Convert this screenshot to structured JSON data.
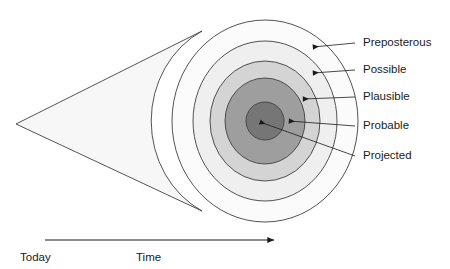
{
  "diagram": {
    "background_color": "#ffffff",
    "stroke_color": "#3f3f3f",
    "text_color": "#1a1a1a",
    "cone": {
      "apex_x": 16,
      "apex_y": 124,
      "fill": "#f7f7f7"
    },
    "center": {
      "x": 265,
      "y": 121
    },
    "zones": [
      {
        "key": "preposterous",
        "label": "Preposterous",
        "fill": "#fbfbfb",
        "rx": 93,
        "ry": 101,
        "label_x": 363,
        "label_y": 43,
        "arrow_tip_x": 313,
        "arrow_tip_y": 47,
        "leader_x": 355,
        "leader_y": 43
      },
      {
        "key": "possible",
        "label": "Possible",
        "fill": "#efefef",
        "rx": 72,
        "ry": 80,
        "label_x": 363,
        "label_y": 70,
        "arrow_tip_x": 313,
        "arrow_tip_y": 73,
        "leader_x": 355,
        "leader_y": 70
      },
      {
        "key": "plausible",
        "label": "Plausible",
        "fill": "#d4d4d4",
        "rx": 55,
        "ry": 60,
        "label_x": 363,
        "label_y": 97,
        "arrow_tip_x": 303,
        "arrow_tip_y": 99,
        "leader_x": 355,
        "leader_y": 97
      },
      {
        "key": "probable",
        "label": "Probable",
        "fill": "#9e9e9e",
        "rx": 40,
        "ry": 43,
        "label_x": 363,
        "label_y": 126,
        "arrow_tip_x": 289,
        "arrow_tip_y": 121,
        "leader_x": 355,
        "leader_y": 126
      },
      {
        "key": "projected",
        "label": "Projected",
        "fill": "#767676",
        "rx": 19,
        "ry": 19,
        "label_x": 363,
        "label_y": 156,
        "arrow_tip_x": 260,
        "arrow_tip_y": 122,
        "leader_x": 355,
        "leader_y": 156
      }
    ],
    "axis": {
      "line_start_x": 45,
      "line_end_x": 274,
      "line_y": 240,
      "start_label": "Today",
      "start_label_x": 20,
      "start_label_y": 258,
      "axis_label": "Time",
      "axis_label_x": 136,
      "axis_label_y": 258
    }
  }
}
